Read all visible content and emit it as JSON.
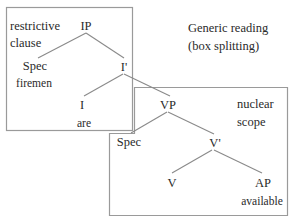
{
  "title": "Generic reading",
  "subtitle": "(box splitting)",
  "boxes": {
    "restrictive_clause": {
      "line1": "restrictive",
      "line2": "clause"
    },
    "nuclear_scope": {
      "line1": "nuclear",
      "line2": "scope"
    }
  },
  "tree": {
    "IP": "IP",
    "Spec_IP": "Spec",
    "Spec_IP_word": "firemen",
    "I_bar": "I'",
    "I": "I",
    "I_word": "are",
    "VP": "VP",
    "Spec_VP": "Spec",
    "V_bar": "V'",
    "V": "V",
    "AP": "AP",
    "AP_word": "available"
  },
  "colors": {
    "line": "#8a8a8a",
    "box": "#9a9a9a",
    "text": "#2a2a2a"
  }
}
